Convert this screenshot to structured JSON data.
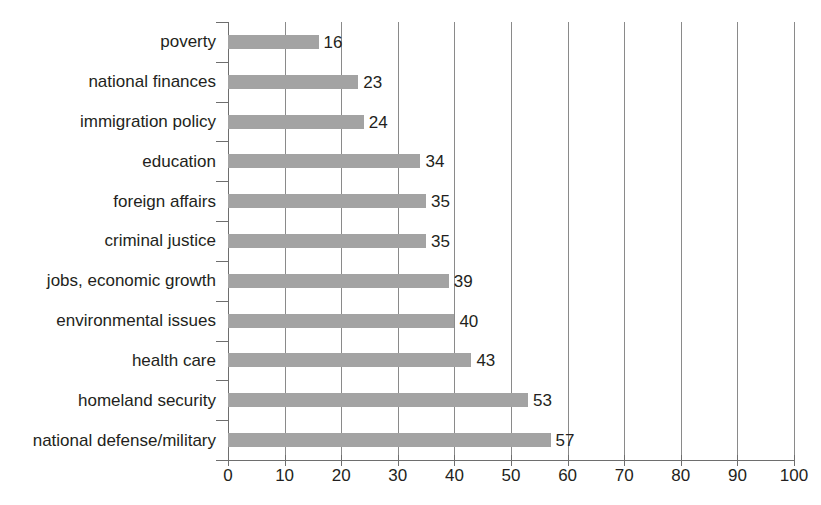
{
  "chart_data": {
    "type": "bar",
    "orientation": "horizontal",
    "title": "",
    "subtitle": "",
    "xlabel": "",
    "ylabel": "",
    "xlim": [
      0,
      100
    ],
    "xticks": [
      0,
      10,
      20,
      30,
      40,
      50,
      60,
      70,
      80,
      90,
      100
    ],
    "xtick_labels": [
      "0",
      "10",
      "20",
      "30",
      "40",
      "50",
      "60",
      "70",
      "80",
      "90",
      "100"
    ],
    "grid": true,
    "grid_axis": "x",
    "legend": false,
    "legend_position": "none",
    "data_labels": true,
    "bar_color": "#a3a3a3",
    "categories": [
      "poverty",
      "national finances",
      "immigration policy",
      "education",
      "foreign affairs",
      "criminal justice",
      "jobs, economic growth",
      "environmental issues",
      "health care",
      "homeland security",
      "national defense/military"
    ],
    "values": [
      16,
      23,
      24,
      34,
      35,
      35,
      39,
      40,
      43,
      53,
      57
    ],
    "value_labels": [
      "16",
      "23",
      "24",
      "34",
      "35",
      "35",
      "39",
      "40",
      "43",
      "53",
      "57"
    ],
    "bars": [
      {
        "category": "poverty",
        "value": 16,
        "label": "16"
      },
      {
        "category": "national finances",
        "value": 23,
        "label": "23"
      },
      {
        "category": "immigration policy",
        "value": 24,
        "label": "24"
      },
      {
        "category": "education",
        "value": 34,
        "label": "34"
      },
      {
        "category": "foreign affairs",
        "value": 35,
        "label": "35"
      },
      {
        "category": "criminal justice",
        "value": 35,
        "label": "35"
      },
      {
        "category": "jobs, economic growth",
        "value": 39,
        "label": "39"
      },
      {
        "category": "environmental issues",
        "value": 40,
        "label": "40"
      },
      {
        "category": "health care",
        "value": 43,
        "label": "43"
      },
      {
        "category": "homeland security",
        "value": 53,
        "label": "53"
      },
      {
        "category": "national defense/military",
        "value": 57,
        "label": "57"
      }
    ]
  },
  "style": {
    "background": "#ffffff",
    "bar_fill": "#a3a3a3",
    "gridline_color": "#8a8a8a",
    "axis_color": "#6e6e6e",
    "text_color": "#231f20"
  }
}
